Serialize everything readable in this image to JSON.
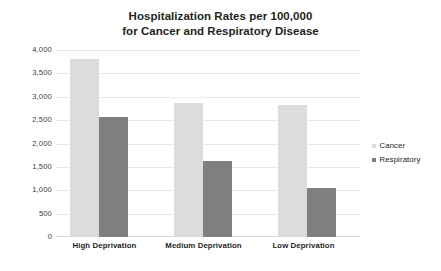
{
  "chart_data": {
    "type": "bar",
    "title": "Hospitalization Rates per 100,000 for Cancer and Respiratory Disease",
    "title_lines": [
      "Hospitalization Rates per 100,000",
      "for Cancer and Respiratory Disease"
    ],
    "categories": [
      "High Deprivation",
      "Medium Deprivation",
      "Low Deprivation"
    ],
    "series": [
      {
        "name": "Cancer",
        "color": "#dcdcdc",
        "values": [
          3830,
          2880,
          2840
        ]
      },
      {
        "name": "Respiratory",
        "color": "#7f7f7f",
        "values": [
          2590,
          1630,
          1060
        ]
      }
    ],
    "xlabel": "",
    "ylabel": "",
    "ylim": [
      0,
      4000
    ],
    "ytick_step": 500,
    "ytick_labels": [
      "4,000",
      "3,500",
      "3,000",
      "2,500",
      "2,000",
      "1,500",
      "1,000",
      "500",
      "0"
    ],
    "ytick_values": [
      4000,
      3500,
      3000,
      2500,
      2000,
      1500,
      1000,
      500,
      0
    ],
    "grid": true,
    "grid_color": "#e8e8e8",
    "legend_position": "right",
    "legend": [
      {
        "label": "Cancer",
        "color": "#dcdcdc"
      },
      {
        "label": "Respiratory",
        "color": "#7f7f7f"
      }
    ],
    "background": "#ffffff"
  }
}
